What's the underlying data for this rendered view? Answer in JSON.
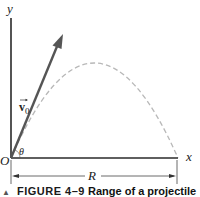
{
  "diagram": {
    "axes": {
      "x_label": "x",
      "y_label": "y",
      "origin_label": "O"
    },
    "velocity": {
      "label_vec": "v",
      "label_sub": "0"
    },
    "angle_label": "θ",
    "range_label": "R",
    "trajectory_style": "dashed parabola"
  },
  "caption": {
    "marker": "▲",
    "figure_number": "FIGURE 4–9",
    "title": "Range of a projectile"
  },
  "colors": {
    "axes": "#2a2a2a",
    "velocity_arrow": "#555555",
    "trajectory": "#b8b8b8",
    "text": "#222222"
  }
}
